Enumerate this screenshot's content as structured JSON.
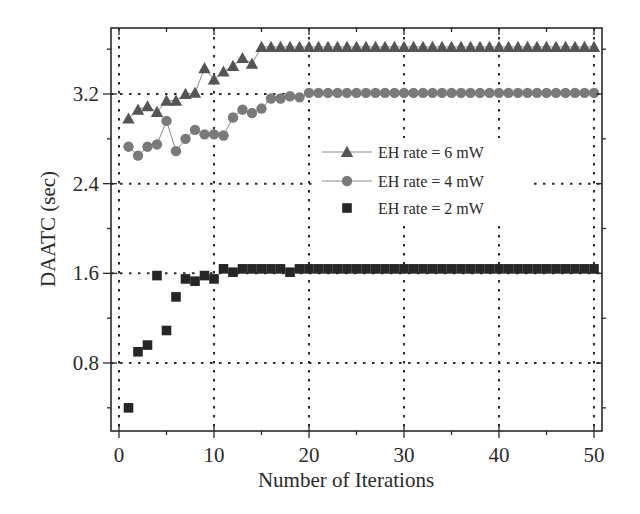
{
  "chart_data": {
    "type": "scatter",
    "title": "",
    "xlabel": "Number of Iterations",
    "ylabel": "DAATC (sec)",
    "xlim": [
      -1,
      51
    ],
    "ylim": [
      0.08,
      3.96
    ],
    "x_ticks": [
      0,
      10,
      20,
      30,
      40,
      50
    ],
    "x_tick_labels": [
      "0",
      "10",
      "20",
      "30",
      "40",
      "50"
    ],
    "x_minor_ticks": [
      5,
      15,
      25,
      35,
      45
    ],
    "y_ticks": [
      0.8,
      1.6,
      2.4,
      3.2
    ],
    "y_tick_labels": [
      "0.8",
      "1.6",
      "2.4",
      "3.2"
    ],
    "y_minor_ticks": [
      0.4,
      1.2,
      2.0,
      2.8,
      3.6
    ],
    "grid": true,
    "grid_style": "dotted",
    "legend_position": "center-right, inside plot",
    "x": [
      1,
      2,
      3,
      4,
      5,
      6,
      7,
      8,
      9,
      10,
      11,
      12,
      13,
      14,
      15,
      16,
      17,
      18,
      19,
      20,
      21,
      22,
      23,
      24,
      25,
      26,
      27,
      28,
      29,
      30,
      31,
      32,
      33,
      34,
      35,
      36,
      37,
      38,
      39,
      40,
      41,
      42,
      43,
      44,
      45,
      46,
      47,
      48,
      49,
      50
    ],
    "series": [
      {
        "name": "EH rate = 6 mW",
        "marker": "triangle",
        "line": true,
        "color": "#555555",
        "values": [
          2.98,
          3.06,
          3.09,
          3.04,
          3.14,
          3.14,
          3.2,
          3.21,
          3.43,
          3.33,
          3.4,
          3.45,
          3.52,
          3.47,
          3.62,
          3.62,
          3.62,
          3.62,
          3.62,
          3.62,
          3.62,
          3.62,
          3.62,
          3.62,
          3.62,
          3.62,
          3.62,
          3.62,
          3.62,
          3.62,
          3.62,
          3.62,
          3.62,
          3.62,
          3.62,
          3.62,
          3.62,
          3.62,
          3.62,
          3.62,
          3.62,
          3.62,
          3.62,
          3.62,
          3.62,
          3.62,
          3.62,
          3.62,
          3.62,
          3.62
        ]
      },
      {
        "name": "EH rate = 4 mW",
        "marker": "circle",
        "line": true,
        "color": "#7a7a7a",
        "values": [
          2.73,
          2.65,
          2.73,
          2.75,
          2.96,
          2.69,
          2.8,
          2.88,
          2.84,
          2.84,
          2.83,
          2.99,
          3.06,
          3.03,
          3.07,
          3.16,
          3.16,
          3.18,
          3.17,
          3.21,
          3.21,
          3.21,
          3.21,
          3.21,
          3.21,
          3.21,
          3.21,
          3.21,
          3.21,
          3.21,
          3.21,
          3.21,
          3.21,
          3.21,
          3.21,
          3.21,
          3.21,
          3.21,
          3.21,
          3.21,
          3.21,
          3.21,
          3.21,
          3.21,
          3.21,
          3.21,
          3.21,
          3.21,
          3.21,
          3.21
        ]
      },
      {
        "name": "EH rate = 2 mW",
        "marker": "square",
        "line": false,
        "color": "#262626",
        "values": [
          0.4,
          0.9,
          0.96,
          1.58,
          1.09,
          1.39,
          1.55,
          1.53,
          1.58,
          1.55,
          1.64,
          1.61,
          1.64,
          1.64,
          1.64,
          1.64,
          1.64,
          1.61,
          1.64,
          1.64,
          1.64,
          1.64,
          1.64,
          1.64,
          1.64,
          1.64,
          1.64,
          1.64,
          1.64,
          1.64,
          1.64,
          1.64,
          1.64,
          1.64,
          1.64,
          1.64,
          1.64,
          1.64,
          1.64,
          1.64,
          1.64,
          1.64,
          1.64,
          1.64,
          1.64,
          1.64,
          1.64,
          1.64,
          1.64,
          1.64
        ]
      }
    ]
  },
  "colors": {
    "axis": "#2a2a2a",
    "grid": "#2a2a2a",
    "background": "#ffffff"
  }
}
